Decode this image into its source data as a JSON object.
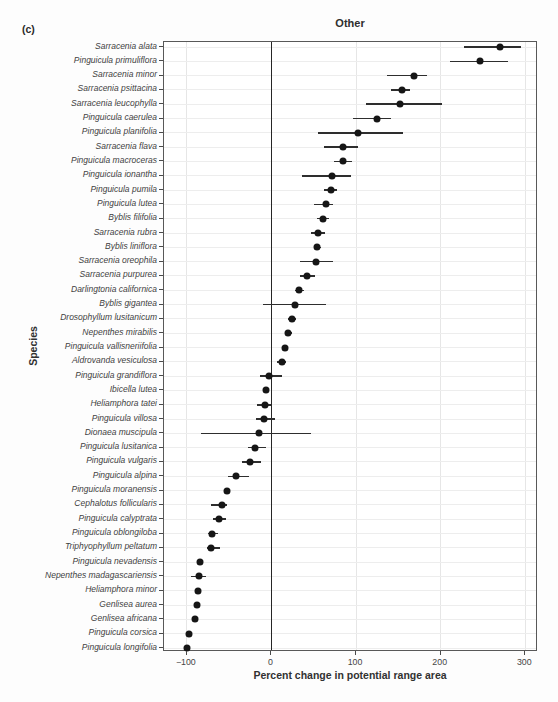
{
  "figure": {
    "panel_label": "(c)"
  },
  "colors": {
    "point": "#161616",
    "errorbar": "#2e2e2e",
    "zero_line": "#262626",
    "grid_horizontal": "#ededed",
    "grid_vertical": "#e6e6e6",
    "panel_border": "#585858",
    "text": "#3f3f3f"
  },
  "chart_data": {
    "type": "scatter",
    "variant": "horizontal-dot-plot-with-error-bars",
    "title": "Other",
    "xlabel": "Percent change in potential range area",
    "ylabel": "Species",
    "xlim": [
      -127,
      315
    ],
    "x_tick_values": [
      -100,
      0,
      100,
      200,
      300
    ],
    "x_tick_labels": [
      "−100",
      "0",
      "100",
      "200",
      "300"
    ],
    "reference_line_x": 0,
    "grid": true,
    "legend": "none",
    "species": [
      {
        "name": "Sarracenia alata",
        "value": 270,
        "lo": 228,
        "hi": 295
      },
      {
        "name": "Pinguicula primuliflora",
        "value": 247,
        "lo": 211,
        "hi": 280
      },
      {
        "name": "Sarracenia minor",
        "value": 168,
        "lo": 136,
        "hi": 184
      },
      {
        "name": "Sarracenia psittacina",
        "value": 154,
        "lo": 141,
        "hi": 164
      },
      {
        "name": "Sarracenia leucophylla",
        "value": 152,
        "lo": 112,
        "hi": 201
      },
      {
        "name": "Pinguicula caerulea",
        "value": 125,
        "lo": 96,
        "hi": 141
      },
      {
        "name": "Pinguicula planifolia",
        "value": 102,
        "lo": 55,
        "hi": 156
      },
      {
        "name": "Sarracenia flava",
        "value": 85,
        "lo": 62,
        "hi": 102
      },
      {
        "name": "Pinguicula macroceras",
        "value": 84,
        "lo": 74,
        "hi": 95
      },
      {
        "name": "Pinguicula ionantha",
        "value": 72,
        "lo": 36,
        "hi": 94
      },
      {
        "name": "Pinguicula pumila",
        "value": 70,
        "lo": 62,
        "hi": 77
      },
      {
        "name": "Pinguicula lutea",
        "value": 65,
        "lo": 50,
        "hi": 73
      },
      {
        "name": "Byblis filifolia",
        "value": 61,
        "lo": 54,
        "hi": 68
      },
      {
        "name": "Sarracenia rubra",
        "value": 55,
        "lo": 47,
        "hi": 63
      },
      {
        "name": "Byblis liniflora",
        "value": 54,
        "lo": 50,
        "hi": 58
      },
      {
        "name": "Sarracenia oreophila",
        "value": 53,
        "lo": 34,
        "hi": 73
      },
      {
        "name": "Sarracenia purpurea",
        "value": 42,
        "lo": 34,
        "hi": 51
      },
      {
        "name": "Darlingtonia californica",
        "value": 33,
        "lo": 28,
        "hi": 38
      },
      {
        "name": "Byblis gigantea",
        "value": 28,
        "lo": -10,
        "hi": 65
      },
      {
        "name": "Drosophyllum lusitanicum",
        "value": 24,
        "lo": 19,
        "hi": 29
      },
      {
        "name": "Nepenthes mirabilis",
        "value": 20,
        "lo": 16,
        "hi": 24
      },
      {
        "name": "Pinguicula vallisneriifolia",
        "value": 16,
        "lo": 12,
        "hi": 20
      },
      {
        "name": "Aldrovanda vesiculosa",
        "value": 12,
        "lo": 7,
        "hi": 17
      },
      {
        "name": "Pinguicula grandiflora",
        "value": -3,
        "lo": -14,
        "hi": 12
      },
      {
        "name": "Ibicella lutea",
        "value": -6,
        "lo": -9,
        "hi": -3
      },
      {
        "name": "Heliamphora tatei",
        "value": -8,
        "lo": -17,
        "hi": 0
      },
      {
        "name": "Pinguicula villosa",
        "value": -9,
        "lo": -18,
        "hi": 4
      },
      {
        "name": "Dionaea muscipula",
        "value": -15,
        "lo": -83,
        "hi": 47
      },
      {
        "name": "Pinguicula lusitanica",
        "value": -20,
        "lo": -28,
        "hi": -7
      },
      {
        "name": "Pinguicula vulgaris",
        "value": -25,
        "lo": -35,
        "hi": -12
      },
      {
        "name": "Pinguicula alpina",
        "value": -42,
        "lo": -51,
        "hi": -27
      },
      {
        "name": "Pinguicula moranensis",
        "value": -52,
        "lo": -55,
        "hi": -49
      },
      {
        "name": "Cephalotus follicularis",
        "value": -59,
        "lo": -71,
        "hi": -52
      },
      {
        "name": "Pinguicula calyptrata",
        "value": -62,
        "lo": -69,
        "hi": -54
      },
      {
        "name": "Pinguicula oblongiloba",
        "value": -70,
        "lo": -75,
        "hi": -63
      },
      {
        "name": "Triphyophyllum peltatum",
        "value": -71,
        "lo": -76,
        "hi": -61
      },
      {
        "name": "Pinguicula nevadensis",
        "value": -84,
        "lo": -87,
        "hi": -81
      },
      {
        "name": "Nepenthes madagascariensis",
        "value": -86,
        "lo": -95,
        "hi": -77
      },
      {
        "name": "Heliamphora minor",
        "value": -87,
        "lo": -89,
        "hi": -85
      },
      {
        "name": "Genlisea aurea",
        "value": -88,
        "lo": -90,
        "hi": -86
      },
      {
        "name": "Genlisea africana",
        "value": -90,
        "lo": -92,
        "hi": -88
      },
      {
        "name": "Pinguicula corsica",
        "value": -98,
        "lo": -100,
        "hi": -96
      },
      {
        "name": "Pinguicula longifolia",
        "value": -100,
        "lo": -100,
        "hi": -98
      }
    ]
  }
}
